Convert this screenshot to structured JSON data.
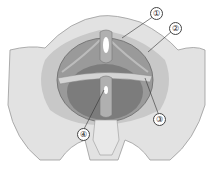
{
  "figure": {
    "colors": {
      "bone": "#e2e2e2",
      "bone_shade": "#c8c8c8",
      "muscle": "#9a9a9a",
      "muscle_dark": "#7c7c7c",
      "outline": "#6a6a6a",
      "leader": "#333333"
    }
  },
  "labels": [
    {
      "id": 1,
      "text": "①",
      "x": 150,
      "y": 7,
      "line_to": [
        122,
        38
      ]
    },
    {
      "id": 2,
      "text": "②",
      "x": 169,
      "y": 22,
      "line_to": [
        148,
        52
      ]
    },
    {
      "id": 3,
      "text": "③",
      "x": 153,
      "y": 113,
      "line_to": [
        145,
        78
      ]
    },
    {
      "id": 4,
      "text": "④",
      "x": 77,
      "y": 128,
      "line_to": [
        104,
        90
      ]
    }
  ]
}
